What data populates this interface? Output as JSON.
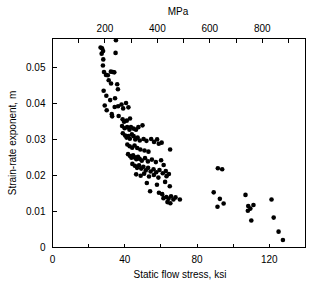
{
  "chart_data": {
    "type": "scatter",
    "title": "",
    "xlabel": "Static flow stress, ksi",
    "ylabel": "Strain-rate exponent, m",
    "top_axis_label": "MPa",
    "xlim": [
      0,
      140
    ],
    "ylim": [
      0,
      0.058
    ],
    "top_xlim": [
      0,
      965
    ],
    "xticks": [
      0,
      20,
      40,
      60,
      80,
      100,
      120,
      140
    ],
    "xtick_labels": [
      "0",
      "",
      "40",
      "",
      "80",
      "",
      "120",
      ""
    ],
    "yticks": [
      0,
      0.01,
      0.02,
      0.03,
      0.04,
      0.05
    ],
    "ytick_labels": [
      "0",
      "0.01",
      "0.02",
      "0.03",
      "0.04",
      "0.05"
    ],
    "top_xticks": [
      100,
      200,
      300,
      400,
      500,
      600,
      700,
      800,
      900
    ],
    "top_xtick_labels": [
      "",
      "200",
      "",
      "400",
      "",
      "600",
      "",
      "800",
      ""
    ],
    "grid": false,
    "legend": false,
    "marker": "filled-circle",
    "marker_color": "#000000",
    "marker_size": 2.3,
    "series_name": "strain-rate exponent data",
    "x_unit": "ksi",
    "y_unit": "m",
    "ksi_to_mpa": 6.895,
    "n_points": 131,
    "points": [
      [
        26.6,
        0.0555
      ],
      [
        27.4,
        0.0553
      ],
      [
        28.0,
        0.0545
      ],
      [
        27.2,
        0.0538
      ],
      [
        28.1,
        0.0522
      ],
      [
        35.1,
        0.0575
      ],
      [
        34.9,
        0.054
      ],
      [
        27.9,
        0.0505
      ],
      [
        28.5,
        0.0487
      ],
      [
        29.6,
        0.0479
      ],
      [
        30.6,
        0.0478
      ],
      [
        32.3,
        0.0488
      ],
      [
        33.4,
        0.0487
      ],
      [
        34.2,
        0.0486
      ],
      [
        31.1,
        0.0464
      ],
      [
        32.4,
        0.0455
      ],
      [
        35.8,
        0.0453
      ],
      [
        36.2,
        0.0439
      ],
      [
        28.3,
        0.0435
      ],
      [
        29.8,
        0.0421
      ],
      [
        31.9,
        0.0409
      ],
      [
        34.6,
        0.0414
      ],
      [
        28.9,
        0.0394
      ],
      [
        30.0,
        0.0381
      ],
      [
        32.8,
        0.037
      ],
      [
        34.4,
        0.039
      ],
      [
        36.3,
        0.0392
      ],
      [
        38.2,
        0.0397
      ],
      [
        39.1,
        0.0386
      ],
      [
        40.7,
        0.0401
      ],
      [
        42.0,
        0.0389
      ],
      [
        33.0,
        0.0364
      ],
      [
        36.6,
        0.0365
      ],
      [
        38.8,
        0.0356
      ],
      [
        39.6,
        0.0349
      ],
      [
        41.1,
        0.0352
      ],
      [
        42.9,
        0.0358
      ],
      [
        38.5,
        0.0337
      ],
      [
        39.9,
        0.0331
      ],
      [
        41.3,
        0.0334
      ],
      [
        42.6,
        0.0327
      ],
      [
        43.4,
        0.0334
      ],
      [
        44.8,
        0.033
      ],
      [
        46.2,
        0.0327
      ],
      [
        47.5,
        0.0334
      ],
      [
        49.8,
        0.0339
      ],
      [
        38.9,
        0.0317
      ],
      [
        40.2,
        0.0311
      ],
      [
        41.0,
        0.0305
      ],
      [
        41.9,
        0.0309
      ],
      [
        42.8,
        0.0302
      ],
      [
        43.9,
        0.0314
      ],
      [
        44.9,
        0.0309
      ],
      [
        45.8,
        0.03
      ],
      [
        47.1,
        0.0305
      ],
      [
        48.3,
        0.0297
      ],
      [
        50.4,
        0.0301
      ],
      [
        52.0,
        0.0296
      ],
      [
        54.6,
        0.0301
      ],
      [
        56.2,
        0.0293
      ],
      [
        57.9,
        0.03
      ],
      [
        58.8,
        0.0288
      ],
      [
        60.4,
        0.0291
      ],
      [
        65.1,
        0.0272
      ],
      [
        41.4,
        0.0286
      ],
      [
        42.7,
        0.0281
      ],
      [
        44.1,
        0.0277
      ],
      [
        45.4,
        0.0283
      ],
      [
        46.9,
        0.0276
      ],
      [
        48.6,
        0.0272
      ],
      [
        50.9,
        0.0269
      ],
      [
        53.1,
        0.0266
      ],
      [
        41.8,
        0.0259
      ],
      [
        42.9,
        0.0254
      ],
      [
        43.7,
        0.0249
      ],
      [
        44.6,
        0.0256
      ],
      [
        45.5,
        0.025
      ],
      [
        46.4,
        0.0245
      ],
      [
        47.3,
        0.0252
      ],
      [
        48.2,
        0.0246
      ],
      [
        49.4,
        0.0241
      ],
      [
        51.2,
        0.0248
      ],
      [
        52.8,
        0.0239
      ],
      [
        55.0,
        0.0244
      ],
      [
        57.2,
        0.0237
      ],
      [
        60.1,
        0.0242
      ],
      [
        61.5,
        0.0229
      ],
      [
        44.2,
        0.0232
      ],
      [
        45.6,
        0.0227
      ],
      [
        46.8,
        0.0221
      ],
      [
        47.9,
        0.0228
      ],
      [
        49.1,
        0.0219
      ],
      [
        50.3,
        0.0224
      ],
      [
        51.6,
        0.0214
      ],
      [
        52.9,
        0.0221
      ],
      [
        54.3,
        0.0211
      ],
      [
        55.9,
        0.0217
      ],
      [
        57.4,
        0.0209
      ],
      [
        59.2,
        0.0215
      ],
      [
        61.0,
        0.0206
      ],
      [
        62.7,
        0.0212
      ],
      [
        64.4,
        0.0204
      ],
      [
        46.3,
        0.0203
      ],
      [
        48.8,
        0.0199
      ],
      [
        50.7,
        0.0205
      ],
      [
        53.4,
        0.0197
      ],
      [
        56.1,
        0.0201
      ],
      [
        58.6,
        0.0194
      ],
      [
        63.1,
        0.0198
      ],
      [
        52.2,
        0.0179
      ],
      [
        57.8,
        0.0174
      ],
      [
        62.3,
        0.0182
      ],
      [
        64.9,
        0.017
      ],
      [
        54.0,
        0.0156
      ],
      [
        58.9,
        0.0152
      ],
      [
        60.7,
        0.0148
      ],
      [
        61.4,
        0.0137
      ],
      [
        63.0,
        0.014
      ],
      [
        64.2,
        0.0135
      ],
      [
        65.6,
        0.0142
      ],
      [
        66.9,
        0.0133
      ],
      [
        68.1,
        0.0139
      ],
      [
        70.5,
        0.0133
      ],
      [
        63.6,
        0.0126
      ],
      [
        65.2,
        0.0123
      ],
      [
        91.5,
        0.022
      ],
      [
        93.9,
        0.0217
      ],
      [
        89.2,
        0.0153
      ],
      [
        92.6,
        0.0135
      ],
      [
        94.7,
        0.0122
      ],
      [
        91.3,
        0.0113
      ],
      [
        106.8,
        0.0146
      ],
      [
        108.3,
        0.0115
      ],
      [
        109.5,
        0.0108
      ],
      [
        108.1,
        0.0102
      ],
      [
        111.2,
        0.0118
      ],
      [
        110.0,
        0.0075
      ],
      [
        121.2,
        0.0133
      ],
      [
        122.4,
        0.0083
      ],
      [
        125.1,
        0.0044
      ],
      [
        127.5,
        0.0021
      ]
    ]
  },
  "axes": {
    "bottom": {
      "title": "Static flow stress, ksi",
      "labels": [
        "0",
        "40",
        "80",
        "120"
      ]
    },
    "left": {
      "title": "Strain-rate exponent, m",
      "labels": [
        "0.05",
        "0.04",
        "0.03",
        "0.02",
        "0.01",
        "0"
      ]
    },
    "top": {
      "title": "MPa",
      "labels": [
        "200",
        "400",
        "600",
        "800"
      ]
    }
  }
}
